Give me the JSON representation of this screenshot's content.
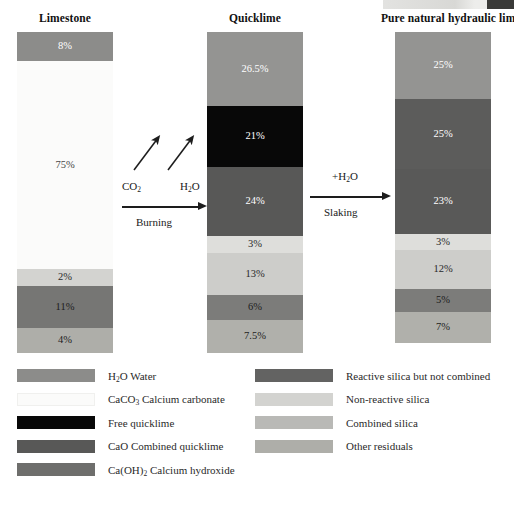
{
  "figure": {
    "background": "#ffffff"
  },
  "palette": {
    "water": "#8c8c8a",
    "calcium_carbonate": "#fbfbfa",
    "free_quicklime": "#080808",
    "combined_quicklime": "#585857",
    "calcium_hydroxide": "#6e6e6c",
    "reactive_silica_not_combined": "#636362",
    "non_reactive_silica": "#d3d3d0",
    "combined_silica": "#b9b9b6",
    "other_residuals": "#aeaea9",
    "text_dark": "#1a1a1a",
    "text_light": "#ffffff"
  },
  "columns": [
    {
      "id": "limestone",
      "title": "Limestone",
      "title_left": 17,
      "title_width": 96,
      "left": 17,
      "top": 32,
      "height": 321,
      "segments": [
        {
          "key": "water",
          "label": "8%",
          "value": 8,
          "color": "#8c8c8a",
          "text_color": "#ffffff",
          "height": 29
        },
        {
          "key": "calcium_carbonate",
          "label": "75%",
          "value": 75,
          "color": "#fbfbfa",
          "text_color": "#444444",
          "height": 208
        },
        {
          "key": "non_reactive_silica",
          "label": "2%",
          "value": 2,
          "color": "#d3d3d0",
          "text_color": "#2a2a2a",
          "height": 17
        },
        {
          "key": "reactive_silica",
          "label": "11%",
          "value": 11,
          "color": "#767674",
          "text_color": "#1d1d1d",
          "height": 42
        },
        {
          "key": "other_residuals",
          "label": "4%",
          "value": 4,
          "color": "#aeaea9",
          "text_color": "#1d1d1d",
          "height": 25
        }
      ]
    },
    {
      "id": "quicklime",
      "title": "Quicklime",
      "title_left": 207,
      "title_width": 96,
      "left": 207,
      "top": 32,
      "height": 321,
      "segments": [
        {
          "key": "water",
          "label": "26.5%",
          "value": 26.5,
          "color": "#949492",
          "text_color": "#ffffff",
          "height": 74
        },
        {
          "key": "free_quicklime",
          "label": "21%",
          "value": 21,
          "color": "#080808",
          "text_color": "#ffffff",
          "height": 61
        },
        {
          "key": "combined_quicklime",
          "label": "24%",
          "value": 24,
          "color": "#585857",
          "text_color": "#ffffff",
          "height": 69
        },
        {
          "key": "non_reactive_silica",
          "label": "3%",
          "value": 3,
          "color": "#dededb",
          "text_color": "#2a2a2a",
          "height": 17
        },
        {
          "key": "combined_silica",
          "label": "13%",
          "value": 13,
          "color": "#cdcdca",
          "text_color": "#2a2a2a",
          "height": 42
        },
        {
          "key": "reactive_silica",
          "label": "6%",
          "value": 6,
          "color": "#7c7c7a",
          "text_color": "#1d1d1d",
          "height": 25
        },
        {
          "key": "other_residuals",
          "label": "7.5%",
          "value": 7.5,
          "color": "#b0b0ab",
          "text_color": "#1d1d1d",
          "height": 33
        }
      ]
    },
    {
      "id": "hydraulic_lime",
      "title": "Pure natural hydraulic lime",
      "title_left": 381,
      "title_width": 124,
      "left": 395,
      "top": 32,
      "height": 321,
      "segments": [
        {
          "key": "water",
          "label": "25%",
          "value": 25,
          "color": "#949492",
          "text_color": "#ffffff",
          "height": 67
        },
        {
          "key": "calcium_hydroxide",
          "label": "25%",
          "value": 25,
          "color": "#5c5c5b",
          "text_color": "#ffffff",
          "height": 70
        },
        {
          "key": "combined_quicklime",
          "label": "23%",
          "value": 23,
          "color": "#595958",
          "text_color": "#ffffff",
          "height": 65
        },
        {
          "key": "non_reactive_silica",
          "label": "3%",
          "value": 3,
          "color": "#dededb",
          "text_color": "#2a2a2a",
          "height": 16
        },
        {
          "key": "combined_silica",
          "label": "12%",
          "value": 12,
          "color": "#cdcdca",
          "text_color": "#2a2a2a",
          "height": 39
        },
        {
          "key": "reactive_silica",
          "label": "5%",
          "value": 5,
          "color": "#7c7c7a",
          "text_color": "#1d1d1d",
          "height": 23
        },
        {
          "key": "other_residuals",
          "label": "7%",
          "value": 7,
          "color": "#b0b0ab",
          "text_color": "#1d1d1d",
          "height": 31
        }
      ]
    }
  ],
  "reactions": [
    {
      "id": "burning",
      "process_label": "Burning",
      "released": [
        {
          "formula_pre": "CO",
          "formula_sub": "2",
          "formula_post": ""
        },
        {
          "formula_pre": "H",
          "formula_sub": "2",
          "formula_post": "O"
        }
      ]
    },
    {
      "id": "slaking",
      "process_label": "Slaking",
      "added": {
        "formula_pre": "+H",
        "formula_sub": "2",
        "formula_post": "O"
      }
    }
  ],
  "legend": {
    "left_column": [
      {
        "key": "water",
        "color": "#8c8c8a",
        "pre": "H",
        "sub": "2",
        "post": "O Water"
      },
      {
        "key": "calcium_carbonate",
        "color": "#fbfbfa",
        "pre": "CaCO",
        "sub": "3",
        "post": " Calcium carbonate"
      },
      {
        "key": "free_quicklime",
        "color": "#080808",
        "pre": "Free quicklime",
        "sub": "",
        "post": ""
      },
      {
        "key": "combined_quicklime",
        "color": "#585857",
        "pre": "CaO Combined quicklime",
        "sub": "",
        "post": ""
      },
      {
        "key": "calcium_hydroxide",
        "color": "#6e6e6c",
        "pre": "Ca(OH)",
        "sub": "2",
        "post": " Calcium hydroxide"
      }
    ],
    "right_column": [
      {
        "key": "reactive_silica_not_combined",
        "color": "#636362",
        "pre": "Reactive silica but not combined",
        "sub": "",
        "post": ""
      },
      {
        "key": "non_reactive_silica",
        "color": "#d3d3d0",
        "pre": "Non-reactive silica",
        "sub": "",
        "post": ""
      },
      {
        "key": "combined_silica",
        "color": "#b9b9b6",
        "pre": "Combined silica",
        "sub": "",
        "post": ""
      },
      {
        "key": "other_residuals",
        "color": "#aeaea9",
        "pre": "Other residuals",
        "sub": "",
        "post": ""
      }
    ]
  }
}
